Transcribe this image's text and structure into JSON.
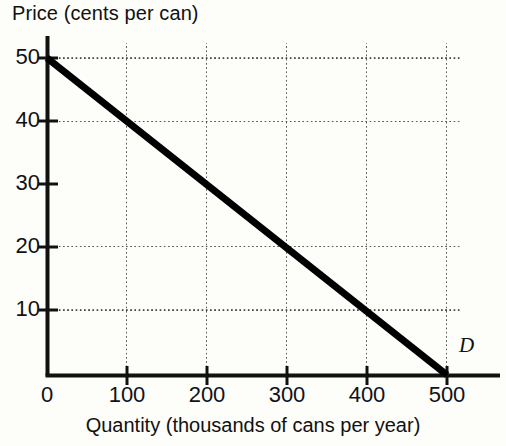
{
  "chart_data": {
    "type": "line",
    "title": "Price (cents per can)",
    "xlabel": "Quantity (thousands of cans per year)",
    "ylabel": "Price (cents per can)",
    "xlim": [
      0,
      500
    ],
    "ylim": [
      0,
      50
    ],
    "xticks": [
      "0",
      "100",
      "200",
      "300",
      "400",
      "500"
    ],
    "xtick_values": [
      0,
      100,
      200,
      300,
      400,
      500
    ],
    "yticks": [
      "10",
      "20",
      "30",
      "40",
      "50"
    ],
    "ytick_values": [
      10,
      20,
      30,
      40,
      50
    ],
    "grid": true,
    "grid_style": "dotted",
    "legend": "none",
    "series": [
      {
        "name": "D",
        "label": "D",
        "description": "Demand curve",
        "color": "#000000",
        "x": [
          0,
          100,
          200,
          300,
          400,
          500
        ],
        "y": [
          50,
          40,
          30,
          20,
          10,
          0
        ]
      }
    ],
    "annotations": [
      {
        "text": "D",
        "x": 520,
        "y": 5
      }
    ]
  },
  "axes": {
    "x_axis_name": "quantity-axis",
    "y_axis_name": "price-axis"
  }
}
